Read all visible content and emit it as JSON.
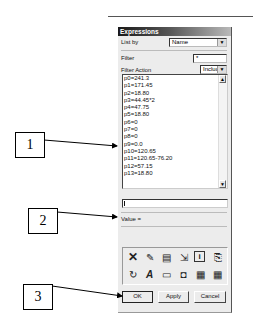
{
  "dialog": {
    "title": "Expressions",
    "list_by_label": "List by",
    "list_by_value": "Name",
    "filter_label": "Filter",
    "filter_value": "*",
    "filter_action_label": "Filter Action",
    "filter_action_value": "Include",
    "save_filter_label": "Save Current Filter",
    "expressions": [
      "p0=241.3",
      "p1=171.45",
      "p2=18.80",
      "p3=44.45*2",
      "p4=47.75",
      "p5=18.80",
      "p6=0",
      "p7=0",
      "p8=0",
      "p9=0.0",
      "p10=120.65",
      "p11=120.65-76.20",
      "p12=57.15",
      "p13=18.80"
    ],
    "expression_input_value": "",
    "value_label": "Value =",
    "toolbar_icons": [
      "delete-icon",
      "edit-icon",
      "list-icon",
      "import-icon",
      "info-icon",
      "export-icon",
      "refresh-icon",
      "rename-icon",
      "open-folder-icon",
      "lock-icon",
      "table-import-icon",
      "table-export-icon"
    ],
    "ok_label": "OK",
    "apply_label": "Apply",
    "cancel_label": "Cancel"
  },
  "callouts": [
    {
      "label": "1"
    },
    {
      "label": "2"
    },
    {
      "label": "3"
    }
  ]
}
